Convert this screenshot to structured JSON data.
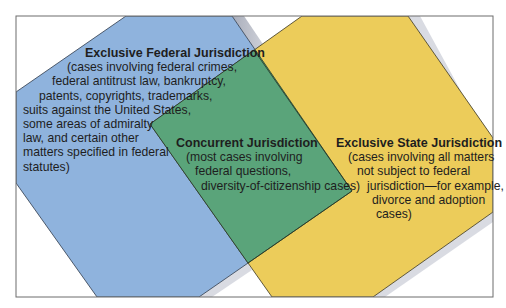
{
  "colors": {
    "background": "#ffffff",
    "frame": "#6d6d6d",
    "federal": "#8fb3dd",
    "concurrent": "#5aa47a",
    "state": "#eccc5a",
    "outline": "#2f3a2a",
    "shadow": "#b9bcc6",
    "text": "#1e1e1e"
  },
  "federal": {
    "title": "Exclusive Federal Jurisdiction",
    "lines": [
      "(cases involving federal crimes,",
      "federal antitrust law, bankruptcy,",
      "patents, copyrights, trademarks,",
      "suits against the United States,",
      "some areas of admiralty",
      "law, and certain other",
      "matters specified in federal",
      "statutes)"
    ]
  },
  "concurrent": {
    "title": "Concurrent Jurisdiction",
    "lines": [
      "(most cases involving",
      "federal questions,",
      "diversity-of-citizenship cases)"
    ]
  },
  "state": {
    "title": "Exclusive State Jurisdiction",
    "lines": [
      "(cases involving all matters",
      "not subject to federal",
      "jurisdiction—for example,",
      "divorce and adoption",
      "cases)"
    ]
  }
}
